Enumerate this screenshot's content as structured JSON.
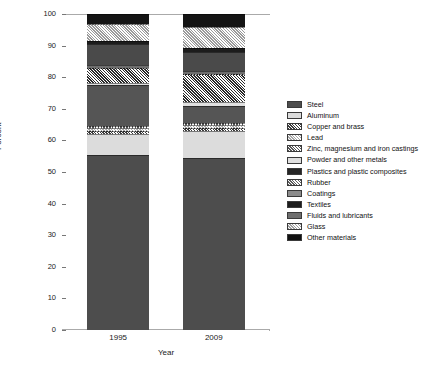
{
  "chart_data": {
    "type": "bar",
    "title": "",
    "subtitle": "",
    "xlabel": "Year",
    "ylabel": "Percent",
    "categories": [
      "1995",
      "2009"
    ],
    "ylim": [
      0,
      100
    ],
    "yticks": [
      0,
      10,
      20,
      30,
      40,
      50,
      60,
      70,
      80,
      90,
      100
    ],
    "grid": false,
    "stacked": true,
    "legend_position": "right",
    "legend_entries": [
      "Steel",
      "Aluminum",
      "Copper and brass",
      "Lead",
      "Zinc, magnesium and iron castings",
      "Powder and other metals",
      "Plastics and plastic composites",
      "Rubber",
      "Coatings",
      "Textiles",
      "Fluids and lubricants",
      "Glass",
      "Other materials"
    ],
    "series": [
      {
        "name": "Steel",
        "values": [
          55.5,
          54.5
        ],
        "color": "#4d4d4d",
        "pattern": "solid"
      },
      {
        "name": "Aluminum",
        "values": [
          6.5,
          8.5
        ],
        "color": "#dcdcdc",
        "pattern": "solid"
      },
      {
        "name": "Copper and brass",
        "values": [
          1.0,
          1.0
        ],
        "color": "#3c3c3c",
        "pattern": "hatch"
      },
      {
        "name": "Lead",
        "values": [
          0.8,
          0.8
        ],
        "color": "#a8a8a8",
        "pattern": "hatch"
      },
      {
        "name": "Zinc, magnesium and iron castings",
        "values": [
          0.7,
          0.7
        ],
        "color": "#575757",
        "pattern": "hatch"
      },
      {
        "name": "Powder and other metals",
        "values": [
          13.0,
          5.5
        ],
        "color": "#555555",
        "pattern": "solid"
      },
      {
        "name": "Plastics and plastic composites",
        "values": [
          0.8,
          1.2
        ],
        "color": "#e0e0e0",
        "pattern": "solid"
      },
      {
        "name": "Rubber",
        "values": [
          4.7,
          8.8
        ],
        "color": "#2a2a2a",
        "pattern": "hatch"
      },
      {
        "name": "Coatings",
        "values": [
          1.0,
          1.0
        ],
        "color": "#6e6e6e",
        "pattern": "solid"
      },
      {
        "name": "Textiles",
        "values": [
          6.5,
          6.0
        ],
        "color": "#4a4a4a",
        "pattern": "solid"
      },
      {
        "name": "Fluids and lubricants",
        "values": [
          1.0,
          1.2
        ],
        "color": "#1c1c1c",
        "pattern": "solid"
      },
      {
        "name": "Glass",
        "values": [
          5.5,
          6.8
        ],
        "color": "#9a9a9a",
        "pattern": "hatch"
      },
      {
        "name": "Other materials",
        "values": [
          3.0,
          4.0
        ],
        "color": "#141414",
        "pattern": "solid"
      }
    ]
  },
  "legend": {
    "items": [
      {
        "label": "Steel",
        "color": "#4d4d4d"
      },
      {
        "label": "Aluminum",
        "color": "#dcdcdc"
      },
      {
        "label": "Copper and brass",
        "color": "#3c3c3c"
      },
      {
        "label": "Lead",
        "color": "#a8a8a8"
      },
      {
        "label": "Zinc, magnesium and iron castings",
        "color": "#575757"
      },
      {
        "label": "Powder and other metals",
        "color": "#e0e0e0"
      },
      {
        "label": "Plastics and plastic composites",
        "color": "#252525"
      },
      {
        "label": "Rubber",
        "color": "#5e5e5e"
      },
      {
        "label": "Coatings",
        "color": "#8c8c8c"
      },
      {
        "label": "Textiles",
        "color": "#1c1c1c"
      },
      {
        "label": "Fluids and lubricants",
        "color": "#6e6e6e"
      },
      {
        "label": "Glass",
        "color": "#a0a0a0"
      },
      {
        "label": "Other materials",
        "color": "#111111"
      }
    ]
  },
  "axes": {
    "y_title": "Percent",
    "x_title": "Year",
    "y_ticks": [
      "0",
      "10",
      "20",
      "30",
      "40",
      "50",
      "60",
      "70",
      "80",
      "90",
      "100"
    ],
    "x_ticks": [
      "1995",
      "2009"
    ]
  }
}
